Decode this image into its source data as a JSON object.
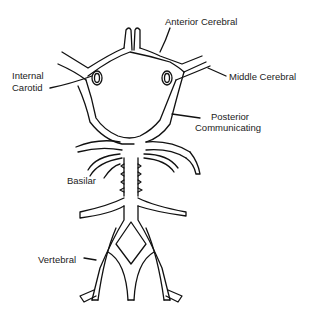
{
  "diagram": {
    "labels": {
      "anterior_cerebral": "Anterior Cerebral",
      "middle_cerebral": "Middle Cerebral",
      "internal_carotid_line1": "Internal",
      "internal_carotid_line2": "Carotid",
      "posterior_communicating_line1": "Posterior",
      "posterior_communicating_line2": "Communicating",
      "basilar": "Basilar",
      "vertebral": "Vertebral"
    },
    "colors": {
      "line": "#111111",
      "text": "#222222",
      "background": "#ffffff"
    }
  }
}
